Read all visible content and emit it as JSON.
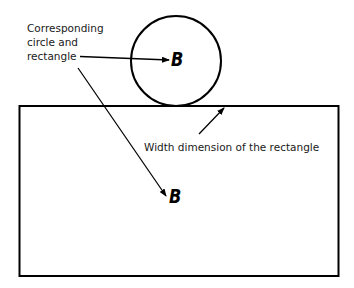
{
  "diagram": {
    "labels": {
      "corresponding": [
        "Corresponding",
        "circle and",
        "rectangle"
      ],
      "width": "Width dimension of the rectangle"
    },
    "shapes": {
      "circle": {
        "letter": "B"
      },
      "rectangle": {
        "letter": "B"
      }
    },
    "colors": {
      "stroke": "#000000",
      "text": "#1a1a1a",
      "background": "#ffffff"
    }
  }
}
